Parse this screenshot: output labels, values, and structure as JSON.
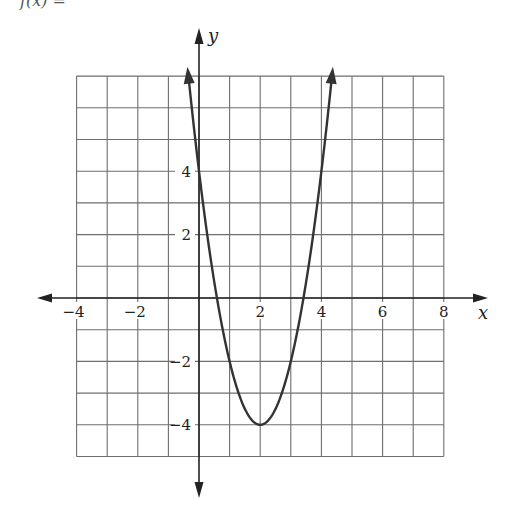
{
  "header": {
    "cut_off_title": "f(x) ="
  },
  "chart_data": {
    "type": "line",
    "title": "",
    "function": "f(x) = 2(x - 2)^2 - 4",
    "xlabel": "x",
    "ylabel": "y",
    "xlim": [
      -4,
      8
    ],
    "ylim": [
      -5,
      7
    ],
    "grid": true,
    "x_tick_labels": [
      {
        "value": -4,
        "label": "−4"
      },
      {
        "value": -2,
        "label": "−2"
      },
      {
        "value": 2,
        "label": "2"
      },
      {
        "value": 4,
        "label": "4"
      },
      {
        "value": 6,
        "label": "6"
      },
      {
        "value": 8,
        "label": "8"
      }
    ],
    "y_tick_labels": [
      {
        "value": 4,
        "label": "4"
      },
      {
        "value": 2,
        "label": "2"
      },
      {
        "value": -2,
        "label": "−2"
      },
      {
        "value": -4,
        "label": "−4"
      }
    ],
    "curve_domain": [
      -0.35,
      4.35
    ],
    "key_points": [
      {
        "name": "y-intercept",
        "x": 0,
        "y": 4
      },
      {
        "name": "vertex",
        "x": 2,
        "y": -4
      },
      {
        "name": "symmetric point",
        "x": 4,
        "y": 4
      }
    ],
    "series": [
      {
        "name": "parabola",
        "x": [
          -0.35,
          0,
          0.5,
          1,
          1.5,
          2,
          2.5,
          3,
          3.5,
          4,
          4.35
        ],
        "y": [
          7.05,
          4,
          0.5,
          -2,
          -3.5,
          -4,
          -3.5,
          -2,
          0.5,
          4,
          7.05
        ]
      }
    ],
    "colors": {
      "grid": "#6e6e6e",
      "axes": "#222222",
      "curve": "#333333"
    }
  }
}
